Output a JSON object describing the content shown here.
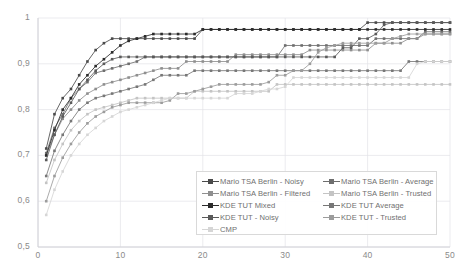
{
  "chart_data": {
    "type": "line",
    "title": "",
    "xlabel": "",
    "ylabel": "",
    "xlim": [
      0,
      50
    ],
    "ylim": [
      0.5,
      1
    ],
    "grid": true,
    "legend_position": "bottom-right",
    "y_ticks": [
      "0,5",
      "0,6",
      "0,7",
      "0,8",
      "0,9",
      "1"
    ],
    "y_tick_values": [
      0.5,
      0.6,
      0.7,
      0.8,
      0.9,
      1.0
    ],
    "x_ticks": [
      "0",
      "10",
      "20",
      "30",
      "40",
      "50"
    ],
    "x_tick_values": [
      0,
      10,
      20,
      30,
      40,
      50
    ],
    "x": [
      1,
      2,
      3,
      4,
      5,
      6,
      7,
      8,
      9,
      10,
      11,
      12,
      13,
      14,
      15,
      16,
      17,
      18,
      19,
      20,
      21,
      22,
      23,
      24,
      25,
      26,
      27,
      28,
      29,
      30,
      31,
      32,
      33,
      34,
      35,
      36,
      37,
      38,
      39,
      40,
      41,
      42,
      43,
      44,
      45,
      46,
      47,
      48,
      49,
      50
    ],
    "series": [
      {
        "name": "Mario TSA Berlin - Noisy",
        "color": "#4a4a4a",
        "marker": "square",
        "values": [
          0.715,
          0.79,
          0.825,
          0.845,
          0.875,
          0.905,
          0.93,
          0.945,
          0.955,
          0.955,
          0.955,
          0.955,
          0.955,
          0.955,
          0.955,
          0.955,
          0.955,
          0.955,
          0.955,
          0.975,
          0.975,
          0.975,
          0.975,
          0.975,
          0.975,
          0.975,
          0.975,
          0.975,
          0.975,
          0.975,
          0.975,
          0.975,
          0.975,
          0.975,
          0.975,
          0.975,
          0.975,
          0.975,
          0.975,
          0.99,
          0.99,
          0.99,
          0.99,
          0.99,
          0.99,
          0.99,
          0.99,
          0.99,
          0.99,
          0.99
        ]
      },
      {
        "name": "Mario TSA Berlin - Average",
        "color": "#6e6e6e",
        "marker": "square",
        "values": [
          0.705,
          0.76,
          0.79,
          0.825,
          0.845,
          0.86,
          0.88,
          0.885,
          0.89,
          0.895,
          0.9,
          0.905,
          0.915,
          0.915,
          0.915,
          0.915,
          0.915,
          0.915,
          0.915,
          0.915,
          0.915,
          0.915,
          0.915,
          0.915,
          0.915,
          0.915,
          0.915,
          0.915,
          0.915,
          0.94,
          0.94,
          0.94,
          0.94,
          0.94,
          0.94,
          0.94,
          0.94,
          0.94,
          0.94,
          0.94,
          0.955,
          0.955,
          0.955,
          0.955,
          0.955,
          0.955,
          0.97,
          0.97,
          0.97,
          0.97
        ]
      },
      {
        "name": "Mario TSA Berlin - Filtered",
        "color": "#8f8f8f",
        "marker": "square",
        "values": [
          0.7,
          0.745,
          0.78,
          0.8,
          0.82,
          0.835,
          0.845,
          0.855,
          0.86,
          0.865,
          0.87,
          0.875,
          0.88,
          0.885,
          0.89,
          0.89,
          0.89,
          0.905,
          0.905,
          0.905,
          0.905,
          0.905,
          0.905,
          0.92,
          0.92,
          0.92,
          0.92,
          0.92,
          0.92,
          0.92,
          0.92,
          0.92,
          0.93,
          0.93,
          0.93,
          0.93,
          0.93,
          0.93,
          0.93,
          0.93,
          0.945,
          0.945,
          0.945,
          0.945,
          0.955,
          0.955,
          0.965,
          0.965,
          0.965,
          0.965
        ]
      },
      {
        "name": "Mario TSA Berlin - Trusted",
        "color": "#c4c4c4",
        "marker": "square",
        "values": [
          0.64,
          0.69,
          0.725,
          0.755,
          0.775,
          0.79,
          0.8,
          0.805,
          0.81,
          0.815,
          0.82,
          0.825,
          0.825,
          0.825,
          0.825,
          0.825,
          0.825,
          0.825,
          0.84,
          0.84,
          0.84,
          0.84,
          0.84,
          0.84,
          0.84,
          0.84,
          0.84,
          0.84,
          0.855,
          0.855,
          0.855,
          0.855,
          0.855,
          0.855,
          0.855,
          0.855,
          0.855,
          0.855,
          0.855,
          0.855,
          0.855,
          0.855,
          0.855,
          0.855,
          0.855,
          0.855,
          0.855,
          0.855,
          0.855,
          0.855
        ]
      },
      {
        "name": "KDE TUT Mixed",
        "color": "#2b2b2b",
        "marker": "square",
        "values": [
          0.7,
          0.755,
          0.8,
          0.825,
          0.855,
          0.875,
          0.895,
          0.91,
          0.925,
          0.94,
          0.95,
          0.955,
          0.96,
          0.965,
          0.965,
          0.965,
          0.965,
          0.965,
          0.965,
          0.975,
          0.975,
          0.975,
          0.975,
          0.975,
          0.975,
          0.975,
          0.975,
          0.975,
          0.975,
          0.975,
          0.975,
          0.975,
          0.975,
          0.975,
          0.975,
          0.975,
          0.975,
          0.975,
          0.975,
          0.975,
          0.975,
          0.975,
          0.975,
          0.975,
          0.975,
          0.975,
          0.975,
          0.975,
          0.975,
          0.975
        ]
      },
      {
        "name": "KDE TUT Average",
        "color": "#777777",
        "marker": "square",
        "values": [
          0.655,
          0.71,
          0.745,
          0.775,
          0.8,
          0.815,
          0.825,
          0.83,
          0.835,
          0.84,
          0.845,
          0.85,
          0.855,
          0.865,
          0.875,
          0.875,
          0.875,
          0.875,
          0.885,
          0.885,
          0.885,
          0.885,
          0.885,
          0.885,
          0.885,
          0.885,
          0.885,
          0.885,
          0.885,
          0.885,
          0.885,
          0.885,
          0.885,
          0.885,
          0.885,
          0.885,
          0.885,
          0.885,
          0.885,
          0.885,
          0.885,
          0.885,
          0.885,
          0.885,
          0.905,
          0.905,
          0.905,
          0.905,
          0.905,
          0.905
        ]
      },
      {
        "name": "KDE TUT - Noisy",
        "color": "#5a5a5a",
        "marker": "square",
        "values": [
          0.69,
          0.745,
          0.785,
          0.815,
          0.845,
          0.865,
          0.885,
          0.9,
          0.91,
          0.915,
          0.915,
          0.915,
          0.915,
          0.915,
          0.915,
          0.915,
          0.915,
          0.915,
          0.915,
          0.915,
          0.915,
          0.915,
          0.915,
          0.915,
          0.915,
          0.915,
          0.915,
          0.915,
          0.915,
          0.915,
          0.915,
          0.915,
          0.915,
          0.915,
          0.915,
          0.915,
          0.935,
          0.935,
          0.955,
          0.955,
          0.965,
          0.985,
          0.99,
          0.99,
          0.99,
          0.99,
          0.99,
          0.99,
          0.99,
          0.99
        ]
      },
      {
        "name": "KDE TUT - Trusted",
        "color": "#9c9c9c",
        "marker": "square",
        "values": [
          0.6,
          0.655,
          0.695,
          0.725,
          0.75,
          0.77,
          0.785,
          0.795,
          0.805,
          0.81,
          0.815,
          0.815,
          0.815,
          0.815,
          0.815,
          0.82,
          0.835,
          0.835,
          0.84,
          0.845,
          0.85,
          0.855,
          0.855,
          0.855,
          0.855,
          0.855,
          0.855,
          0.86,
          0.875,
          0.875,
          0.885,
          0.885,
          0.9,
          0.925,
          0.935,
          0.94,
          0.945,
          0.945,
          0.945,
          0.945,
          0.945,
          0.945,
          0.955,
          0.96,
          0.965,
          0.965,
          0.965,
          0.965,
          0.965,
          0.965
        ]
      },
      {
        "name": "CMP",
        "color": "#d6d6d6",
        "marker": "square",
        "values": [
          0.57,
          0.625,
          0.665,
          0.7,
          0.725,
          0.745,
          0.76,
          0.775,
          0.785,
          0.795,
          0.8,
          0.805,
          0.81,
          0.815,
          0.82,
          0.825,
          0.825,
          0.825,
          0.825,
          0.825,
          0.825,
          0.825,
          0.825,
          0.835,
          0.835,
          0.835,
          0.84,
          0.845,
          0.845,
          0.85,
          0.87,
          0.87,
          0.87,
          0.87,
          0.87,
          0.87,
          0.87,
          0.87,
          0.87,
          0.87,
          0.87,
          0.87,
          0.87,
          0.87,
          0.87,
          0.9,
          0.905,
          0.905,
          0.905,
          0.905
        ]
      }
    ]
  },
  "legend": {
    "columns": [
      {
        "items": [
          {
            "label": "Mario TSA Berlin - Noisy",
            "color": "#4a4a4a"
          },
          {
            "label": "Mario TSA Berlin - Filtered",
            "color": "#8f8f8f"
          },
          {
            "label": "KDE TUT Mixed",
            "color": "#2b2b2b"
          },
          {
            "label": "KDE TUT - Noisy",
            "color": "#5a5a5a"
          },
          {
            "label": "CMP",
            "color": "#d6d6d6"
          }
        ]
      },
      {
        "items": [
          {
            "label": "Mario TSA Berlin - Average",
            "color": "#6e6e6e"
          },
          {
            "label": "Mario TSA Berlin - Trusted",
            "color": "#c4c4c4"
          },
          {
            "label": "KDE TUT Average",
            "color": "#777777"
          },
          {
            "label": "KDE TUT - Trusted",
            "color": "#9c9c9c"
          }
        ]
      }
    ]
  },
  "style": {
    "grid_color": "#e3e3e8",
    "axis_color": "#cfcfd4",
    "tick_text_color": "#8a8a8a",
    "background": "#ffffff"
  }
}
